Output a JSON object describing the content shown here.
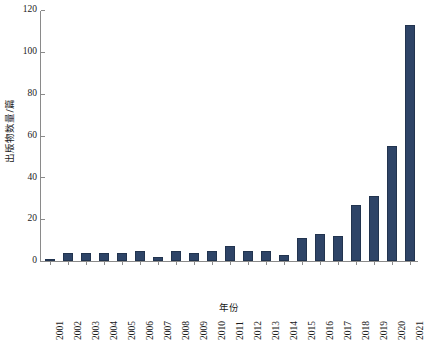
{
  "chart_data": {
    "type": "bar",
    "title": "",
    "xlabel": "年份",
    "ylabel": "出版物数量/篇",
    "categories": [
      "2001",
      "2002",
      "2003",
      "2004",
      "2005",
      "2006",
      "2007",
      "2008",
      "2009",
      "2010",
      "2011",
      "2012",
      "2013",
      "2014",
      "2015",
      "2016",
      "2017",
      "2018",
      "2019",
      "2020",
      "2021"
    ],
    "values": [
      1,
      4,
      4,
      4,
      4,
      5,
      2,
      5,
      4,
      5,
      7,
      5,
      5,
      3,
      11,
      13,
      12,
      27,
      31,
      55,
      113
    ],
    "ylim": [
      0,
      120
    ],
    "yticks": [
      0,
      20,
      40,
      60,
      80,
      100,
      120
    ],
    "ytick_labels": [
      "0",
      "20",
      "40",
      "60",
      "80",
      "100",
      "120"
    ],
    "grid": false,
    "legend": "none",
    "bar_color": "#2e4467",
    "axis_color": "#8a8a8a",
    "text_color": "#1a1a1a"
  }
}
